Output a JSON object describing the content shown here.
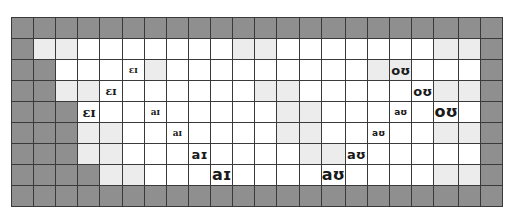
{
  "grid": {
    "columns": 22,
    "rows": 9,
    "colors": {
      "dark": "#8f8f8f",
      "light": "#ececec",
      "white": "#ffffff",
      "line": "#3a3a3a"
    },
    "fill_rows": [
      "DDDDDDDDDDDDDDDDDDDDDD",
      "DLLWWWWWWWLLWWWWWWWLLD",
      "DDWWWWLWWWWWWWWWLLWWWD",
      "DDLLWWWWWWWLLWWWWWWLLD",
      "DDDWWWWWWWWWLLWWWWWWWD",
      "DDDLLWWWWWWWLLWWWWWLLD",
      "DDDLLWWWWWWWWLLWWWWWWD",
      "DDDDLLWWWWWWWWWWWWWLLD",
      "DDDDDDDDDDDDDDDDDDDDDD"
    ]
  },
  "labels": [
    {
      "row": 2,
      "col": 5,
      "text": "ɛɪ",
      "size": 1,
      "font": "serif"
    },
    {
      "row": 3,
      "col": 4,
      "text": "ɛɪ",
      "size": 2,
      "font": "serif"
    },
    {
      "row": 4,
      "col": 3,
      "text": "ɛɪ",
      "size": 3,
      "font": "serif"
    },
    {
      "row": 4,
      "col": 6,
      "text": "aɪ",
      "size": 1,
      "font": "serif"
    },
    {
      "row": 5,
      "col": 7,
      "text": "aɪ",
      "size": 1,
      "font": "serif"
    },
    {
      "row": 6,
      "col": 8,
      "text": "aɪ",
      "size": 3,
      "font": "sans"
    },
    {
      "row": 7,
      "col": 9,
      "text": "aɪ",
      "size": 4,
      "font": "sans"
    },
    {
      "row": 2,
      "col": 17,
      "text": "oʊ",
      "size": 3,
      "font": "sans"
    },
    {
      "row": 3,
      "col": 18,
      "text": "oʊ",
      "size": 3,
      "font": "sans"
    },
    {
      "row": 4,
      "col": 19,
      "text": "oʊ",
      "size": 4,
      "font": "sans"
    },
    {
      "row": 4,
      "col": 17,
      "text": "aʊ",
      "size": 1,
      "font": "sans"
    },
    {
      "row": 5,
      "col": 16,
      "text": "aʊ",
      "size": 1,
      "font": "sans"
    },
    {
      "row": 6,
      "col": 15,
      "text": "aʊ",
      "size": 3,
      "font": "sans"
    },
    {
      "row": 7,
      "col": 14,
      "text": "aʊ",
      "size": 4,
      "font": "sans"
    }
  ]
}
